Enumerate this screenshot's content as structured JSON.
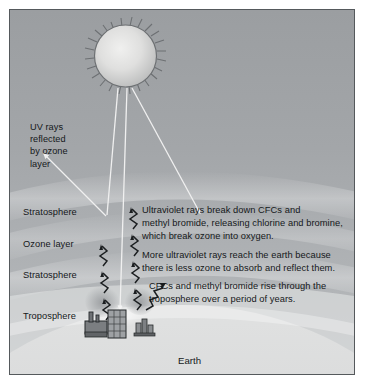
{
  "diagram": {
    "labels": {
      "uv_reflected": "UV rays\nreflected\nby ozone\nlayer",
      "stratosphere_upper": "Stratosphere",
      "ozone_layer": "Ozone layer",
      "stratosphere_lower": "Stratosphere",
      "troposphere": "Troposphere",
      "earth": "Earth"
    },
    "paragraphs": {
      "uv_breaks_cfcs": "Ultraviolet rays break down CFCs and\nmethyl bromide, releasing chlorine and bromine,\nwhich break ozone into oxygen.",
      "more_uv_reaches": "More ultraviolet rays reach the earth because\nthere is less ozone to absorb and reflect them.",
      "cfcs_rise": "CFCs and methyl bromide rise through the\ntroposphere over a period of years."
    },
    "icons": {
      "sun": "sun-icon",
      "factory": "factory-icon",
      "buildings": "buildings-icon",
      "uv_ray_down": "uv-ray-down-arrow-icon",
      "uv_ray_reflected": "uv-ray-reflected-arrow-icon",
      "cfc_rising": "cfc-rising-zigzag-arrow-icon"
    },
    "colors": {
      "sky_top": "#9a9da0",
      "sky_mid": "#abaeb1",
      "sky_horizon": "#d7d8d9",
      "earth": "#cfd0d1",
      "ray_white": "#f2f2f2",
      "ink": "#15181a",
      "frame": "#55595c"
    }
  }
}
